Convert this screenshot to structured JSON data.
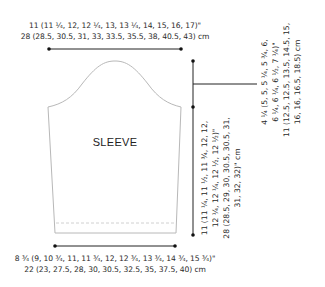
{
  "diagram": {
    "piece_label": "SLEEVE",
    "upper_width": {
      "inches": "11 (11 ¼, 12, 12 ¼, 13, 13 ¼, 14, 15, 16, 17)\"",
      "cm": "28 (28.5, 30.5, 31, 33, 33.5, 35.5, 38, 40.5, 43) cm"
    },
    "cuff_width": {
      "inches": "8 ¾ (9, 10 ¾, 11, 11 ¾, 12, 12 ¾, 13 ¾, 14 ¾, 15 ¾)\"",
      "cm": "22 (23, 27.5, 28, 30, 30.5, 32.5, 35, 37.5, 40) cm"
    },
    "sleeve_length": {
      "line1": "11 (11 ¼, 11 ½, 11 ¾, 12, 12,",
      "line2": "12 ¼, 12 ¼, 12 ½, 12 ½)\"",
      "line3": "28 (28.5, 29, 30, 30.5, 30.5, 31,",
      "line4": "31, 32, 32)\" cm"
    },
    "cap_height": {
      "line1": "4 ¼ (5, 5, 5 ¼, 5 ¾, 6,",
      "line2": "6 ¼, 6 ¼, 6 ½, 7 ¼)\"",
      "line3": "11 (12.5, 12.5, 13.5, 14.5, 15,",
      "line4": "16, 16, 16.5, 18.5) cm"
    },
    "colors": {
      "outline": "#b8b8b8",
      "dimension_line": "#222222",
      "dashed": "#c4c4c4"
    }
  }
}
